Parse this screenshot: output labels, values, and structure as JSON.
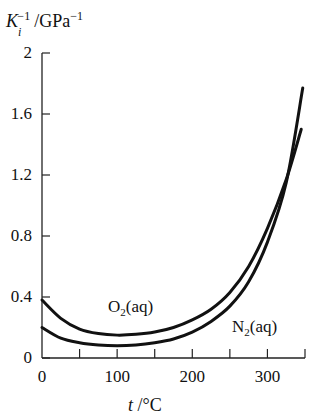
{
  "chart_data": {
    "type": "line",
    "title": "",
    "ylabel": "K_i^-1/GPa^-1",
    "xlabel": "t /°C",
    "xlim": [
      0,
      350
    ],
    "ylim": [
      0,
      2
    ],
    "grid": false,
    "legend": "inline labels",
    "x_ticks": [
      0,
      100,
      200,
      300
    ],
    "x_minor_ticks": [
      50,
      150,
      250,
      350
    ],
    "y_ticks": [
      0,
      0.4,
      0.8,
      1.2,
      1.6,
      2
    ],
    "y_tick_labels": [
      "0",
      "0.4",
      "0.8",
      "1.2",
      "1.6",
      "2"
    ],
    "x_tick_labels": [
      "0",
      "100",
      "200",
      "300"
    ],
    "series": [
      {
        "name": "O2(aq)",
        "label_main": "O",
        "label_sub": "2",
        "label_suffix": "(aq)",
        "x": [
          0,
          25,
          50,
          75,
          100,
          125,
          150,
          175,
          200,
          225,
          250,
          275,
          300,
          325,
          345
        ],
        "y": [
          0.38,
          0.26,
          0.19,
          0.16,
          0.15,
          0.155,
          0.17,
          0.2,
          0.25,
          0.32,
          0.43,
          0.6,
          0.85,
          1.17,
          1.5
        ]
      },
      {
        "name": "N2(aq)",
        "label_main": "N",
        "label_sub": "2",
        "label_suffix": "(aq)",
        "x": [
          0,
          25,
          50,
          75,
          100,
          125,
          150,
          175,
          200,
          225,
          250,
          275,
          300,
          325,
          347
        ],
        "y": [
          0.2,
          0.13,
          0.1,
          0.085,
          0.08,
          0.085,
          0.1,
          0.125,
          0.17,
          0.24,
          0.34,
          0.5,
          0.76,
          1.15,
          1.77
        ]
      }
    ]
  },
  "axis": {
    "y_label_main": "K",
    "y_label_sub": "i",
    "y_label_sup": "−1",
    "y_label_unit": "/GPa",
    "y_label_unit_sup": "−1",
    "x_label_var": "t",
    "x_label_unit": " /°C"
  },
  "colors": {
    "line": "#111111",
    "axis": "#222222",
    "background": "#ffffff"
  }
}
